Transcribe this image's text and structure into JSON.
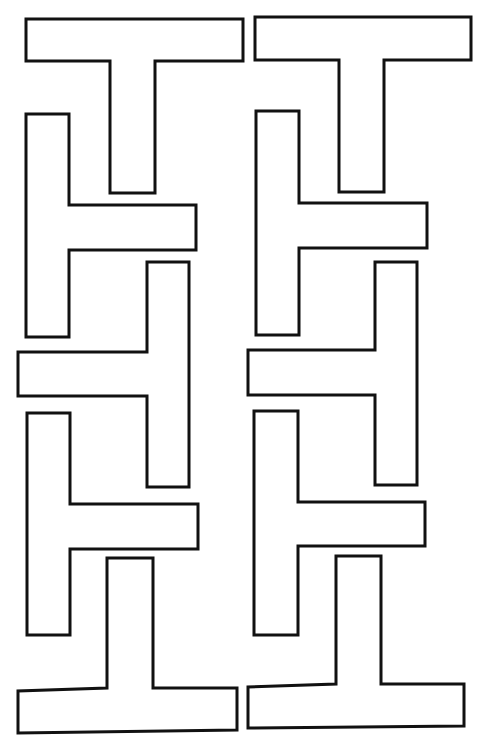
{
  "colors": {
    "stroke": "#111111",
    "fill": "#ffffff",
    "background": "#ffffff"
  },
  "stroke_width": 3,
  "columns": [
    {
      "name": "left-column",
      "shapes": [
        {
          "name": "t-shape-upright",
          "orientation": "up",
          "points": "26,19 243,19 243,61 155,61 155,193 110,193 110,61 26,61"
        },
        {
          "name": "t-shape-right",
          "orientation": "right",
          "points": "26,114 69,114 69,205 196,205 196,250 69,250 69,337 26,337"
        },
        {
          "name": "t-shape-left",
          "orientation": "left",
          "points": "147,262 189,262 189,487 147,487 147,396 18,396 18,352 147,352"
        },
        {
          "name": "t-shape-right",
          "orientation": "right",
          "points": "27,413 70,413 70,504 198,504 198,549 70,549 70,635 27,635"
        },
        {
          "name": "t-shape-inverted",
          "orientation": "down",
          "points": "107,558 153,558 153,688 237,688 237,730 18,733 18,691 107,688"
        }
      ]
    },
    {
      "name": "right-column",
      "shapes": [
        {
          "name": "t-shape-upright",
          "orientation": "up",
          "points": "255,17 471,17 471,60 384,60 384,192 339,192 339,60 255,60"
        },
        {
          "name": "t-shape-right",
          "orientation": "right",
          "points": "256,111 299,111 299,203 427,203 427,248 299,248 299,335 256,335"
        },
        {
          "name": "t-shape-left",
          "orientation": "left",
          "points": "375,262 417,262 417,485 375,485 375,395 248,395 248,350 375,350"
        },
        {
          "name": "t-shape-right",
          "orientation": "right",
          "points": "254,411 298,411 298,502 425,502 425,546 298,546 298,635 254,635"
        },
        {
          "name": "t-shape-inverted",
          "orientation": "down",
          "points": "336,556 381,556 381,684 464,684 464,726 248,728 248,687 336,684"
        }
      ]
    }
  ],
  "caption": "",
  "caption_note": "Partially cropped text at bottom edge (illegible)"
}
